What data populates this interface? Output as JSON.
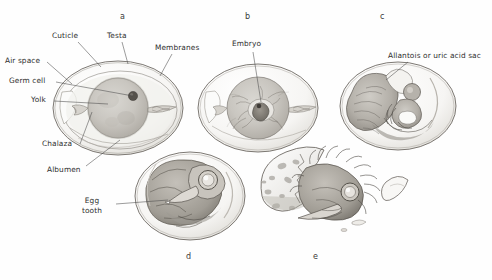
{
  "figure": {
    "background_color": "#fefefe",
    "ink_color": "#2e2e2e",
    "panels": [
      {
        "letter": "a",
        "x": 120,
        "y": 12,
        "caption": "Unincubated egg in cross-section"
      },
      {
        "letter": "b",
        "x": 245,
        "y": 12,
        "caption": "Early embryo on yolk"
      },
      {
        "letter": "c",
        "x": 380,
        "y": 12,
        "caption": "Embryo with allantois"
      },
      {
        "letter": "d",
        "x": 186,
        "y": 252,
        "caption": "Late embryo with egg tooth"
      },
      {
        "letter": "e",
        "x": 313,
        "y": 252,
        "caption": "Chick hatching from shell"
      }
    ],
    "labels": [
      {
        "id": "cuticle",
        "text": "Cuticle",
        "x": 52,
        "y": 36
      },
      {
        "id": "testa",
        "text": "Testa",
        "x": 107,
        "y": 36
      },
      {
        "id": "membranes",
        "text": "Membranes",
        "x": 155,
        "y": 48
      },
      {
        "id": "air-space",
        "text": "Air space",
        "x": 12,
        "y": 61
      },
      {
        "id": "germ-cell",
        "text": "Germ cell",
        "x": 16,
        "y": 81
      },
      {
        "id": "yolk",
        "text": "Yolk",
        "x": 36,
        "y": 100
      },
      {
        "id": "chalaza",
        "text": "Chalaza",
        "x": 42,
        "y": 145
      },
      {
        "id": "albumen",
        "text": "Albumen",
        "x": 48,
        "y": 171
      },
      {
        "id": "embryo",
        "text": "Embryo",
        "x": 232,
        "y": 44
      },
      {
        "id": "allantois",
        "text": "Allantois or uric acid sac",
        "x": 390,
        "y": 56
      },
      {
        "id": "egg-tooth",
        "text": "Egg\ntooth",
        "x": 84,
        "y": 200
      }
    ]
  }
}
